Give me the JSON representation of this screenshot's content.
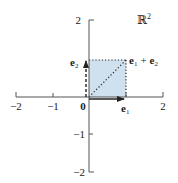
{
  "diagram": {
    "space_label": "ℝ",
    "space_exponent": "2",
    "colors": {
      "axis": "#555555",
      "fill": "#cfe0ee",
      "vector": "#222222",
      "text": "#222222"
    },
    "x_ticks": [
      {
        "value": -2,
        "label": "−2"
      },
      {
        "value": -1,
        "label": "−1"
      },
      {
        "value": 2,
        "label": "2"
      }
    ],
    "y_ticks": [
      {
        "value": 2,
        "label": "2"
      },
      {
        "value": -1,
        "label": "−1"
      },
      {
        "value": -2,
        "label": "−2"
      }
    ],
    "origin_label": "0",
    "vectors": {
      "e1": {
        "base": "e",
        "sub": "1",
        "to": [
          1,
          0
        ],
        "style": "solid"
      },
      "e2": {
        "base": "e",
        "sub": "2",
        "to": [
          0,
          1
        ],
        "style": "dashed"
      },
      "sum": {
        "label_base1": "e",
        "label_sub1": "1",
        "plus": "+",
        "label_base2": "e",
        "label_sub2": "2",
        "to": [
          1,
          1
        ],
        "style": "dotted"
      }
    }
  }
}
